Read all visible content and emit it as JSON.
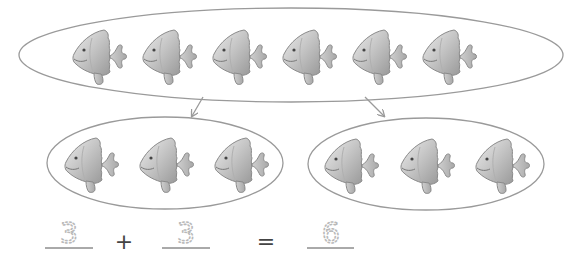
{
  "diagram": {
    "colors": {
      "outline": "#9a9a9a",
      "fish_body_light": "#e2e2e2",
      "fish_body_dark": "#9f9f9f",
      "fish_outline": "#8a8a8a",
      "dotted_digit": "#b9b9b9",
      "line": "#555555"
    },
    "top_group": {
      "count": 6,
      "icon": "fish-icon"
    },
    "left_group": {
      "count": 3,
      "icon": "fish-icon"
    },
    "right_group": {
      "count": 3,
      "icon": "fish-icon"
    },
    "equation": {
      "addend1": "3",
      "plus": "+",
      "addend2": "3",
      "equals": "=",
      "sum": "6"
    }
  }
}
